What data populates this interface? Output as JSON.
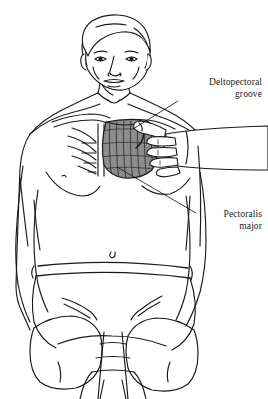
{
  "figure": {
    "background_color": "#ffffff",
    "line_color": "#1a1a1a",
    "muscle_shading_color": "#8c8c8c",
    "skin_fill_color": "#ffffff"
  },
  "annotations": [
    {
      "id": "deltopectoral-groove",
      "line_1": "Deltopectoral",
      "line_2": "groove",
      "leader_from": {
        "x": 178,
        "y": 100
      },
      "leader_to": {
        "x": 134,
        "y": 129
      }
    },
    {
      "id": "pectoralis-major",
      "line_1": "Pectoralis",
      "line_2": "major",
      "leader_from": {
        "x": 196,
        "y": 212
      },
      "leader_to": {
        "x": 118,
        "y": 168
      }
    }
  ],
  "subject": {
    "parts": [
      "head",
      "hair",
      "face",
      "eyes",
      "nose",
      "mouth",
      "ears",
      "neck",
      "clavicle",
      "sternal-notch",
      "ribs",
      "chest",
      "pectoralis-major-muscle",
      "deltopectoral-groove",
      "left-arm",
      "right-arm",
      "abdomen",
      "navel",
      "waistband",
      "shorts",
      "left-thigh",
      "right-thigh",
      "draped-cloth"
    ]
  },
  "examiner": {
    "parts": [
      "forearm",
      "wrist",
      "hand",
      "thumb",
      "index-finger",
      "middle-finger",
      "ring-finger",
      "little-finger"
    ],
    "action": "grasping pectoralis major between thumb and fingers"
  }
}
